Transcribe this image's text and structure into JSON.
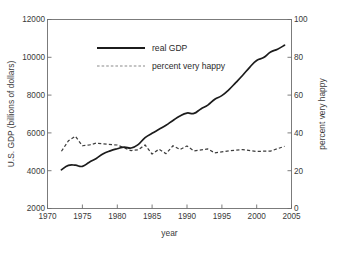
{
  "chart_data": {
    "type": "line",
    "title": "",
    "xlabel": "year",
    "ylabel": "U.S. GDP (billions of dollars)",
    "y2label": "percent very happy",
    "xlim": [
      1970,
      2005
    ],
    "ylim": [
      2000,
      12000
    ],
    "y2lim": [
      0,
      100
    ],
    "grid": false,
    "legend_position": "upper-center",
    "xticks": [
      "1970",
      "1975",
      "1980",
      "1985",
      "1990",
      "1995",
      "2000",
      "2005"
    ],
    "xtick_values": [
      1970,
      1975,
      1980,
      1985,
      1990,
      1995,
      2000,
      2005
    ],
    "yticks": [
      "2000",
      "4000",
      "6000",
      "8000",
      "10000",
      "12000"
    ],
    "ytick_values": [
      2000,
      4000,
      6000,
      8000,
      10000,
      12000
    ],
    "y2ticks": [
      "0",
      "20",
      "40",
      "60",
      "80",
      "100"
    ],
    "y2tick_values": [
      0,
      20,
      40,
      60,
      80,
      100
    ],
    "series": [
      {
        "name": "real GDP",
        "axis": "left",
        "style": "solid",
        "color": "#1c1c1c",
        "x": [
          1972,
          1973,
          1974,
          1975,
          1976,
          1977,
          1978,
          1979,
          1980,
          1981,
          1982,
          1983,
          1984,
          1985,
          1986,
          1987,
          1988,
          1989,
          1990,
          1991,
          1992,
          1993,
          1994,
          1995,
          1996,
          1997,
          1998,
          1999,
          2000,
          2001,
          2002,
          2003,
          2004
        ],
        "values": [
          4050,
          4280,
          4290,
          4230,
          4450,
          4650,
          4900,
          5050,
          5160,
          5250,
          5200,
          5380,
          5750,
          5980,
          6190,
          6400,
          6660,
          6900,
          7050,
          7030,
          7270,
          7470,
          7780,
          7970,
          8280,
          8660,
          9050,
          9470,
          9830,
          9990,
          10280,
          10430,
          10640
        ]
      },
      {
        "name": "percent very happy",
        "axis": "right",
        "style": "dashed",
        "color": "#3d3d3d",
        "x": [
          1972,
          1973,
          1974,
          1975,
          1976,
          1977,
          1978,
          1980,
          1982,
          1983,
          1984,
          1985,
          1986,
          1987,
          1988,
          1989,
          1990,
          1991,
          1993,
          1994,
          1996,
          1998,
          2000,
          2002,
          2004
        ],
        "values": [
          30.3,
          35.8,
          38.2,
          33.2,
          33.6,
          34.6,
          34.2,
          33.6,
          30.6,
          31.1,
          33.6,
          28.8,
          31.4,
          29.0,
          33.2,
          31.2,
          33.1,
          30.5,
          31.5,
          29.4,
          30.5,
          31.2,
          30.2,
          30.4,
          32.9
        ]
      }
    ],
    "legend": [
      {
        "label": "real GDP",
        "style": "solid"
      },
      {
        "label": "percent very happy",
        "style": "dashed"
      }
    ]
  },
  "figure": {
    "background_color": "#ffffff",
    "axis_color": "#6e6e6e",
    "text_color": "#3a3a3a"
  }
}
